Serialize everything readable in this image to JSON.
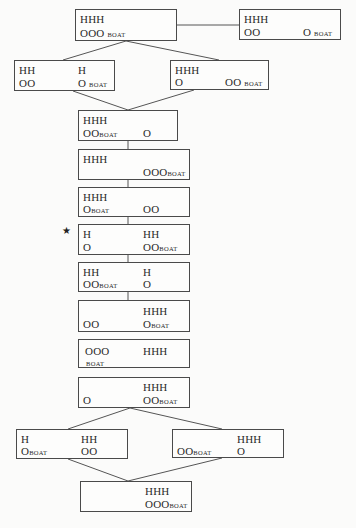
{
  "diagram": {
    "title": "",
    "boat_label": "BOAT",
    "marker": "★",
    "nodes": [
      {
        "id": "n0",
        "tl": "HHH",
        "bl": "OOO",
        "bl_boat": "BOAT",
        "tr": "",
        "br": ""
      },
      {
        "id": "n1",
        "tl": "HHH",
        "bl": "OO",
        "tr": "",
        "br": "O",
        "br_boat": "BOAT"
      },
      {
        "id": "n2",
        "tl": "HH",
        "bl": "OO",
        "tr": "H",
        "br": "O",
        "br_boat": "BOAT"
      },
      {
        "id": "n3",
        "tl": "HHH",
        "bl": "O",
        "tr": "",
        "br": "OO",
        "br_boat": "BOAT"
      },
      {
        "id": "n4",
        "tl": "HHH",
        "bl": "OO",
        "bl_boat": "BOAT",
        "tr": "",
        "br": "O"
      },
      {
        "id": "n5",
        "tl": "HHH",
        "bl": "",
        "tr": "",
        "br": "OOO",
        "br_boat": "BOAT"
      },
      {
        "id": "n6",
        "tl": "HHH",
        "bl": "O",
        "bl_boat": "BOAT",
        "tr": "",
        "br": "OO"
      },
      {
        "id": "n7",
        "tl": "H",
        "bl": "O",
        "tr": "HH",
        "br": "OO",
        "br_boat": "BOAT",
        "starred": true
      },
      {
        "id": "n8",
        "tl": "HH",
        "bl": "OO",
        "bl_boat": "BOAT",
        "tr": "H",
        "br": "O"
      },
      {
        "id": "n9",
        "tl": "",
        "bl": "OO",
        "tr": "HHH",
        "br": "O",
        "br_boat": "BOAT"
      },
      {
        "id": "n10",
        "tl": "OOO",
        "bl": "",
        "bl_boat": "BOAT",
        "tr": "HHH",
        "br": ""
      },
      {
        "id": "n11",
        "tl": "",
        "bl": "O",
        "tr": "HHH",
        "br": "OO",
        "br_boat": "BOAT"
      },
      {
        "id": "n12",
        "tl": "H",
        "bl": "O",
        "bl_boat": "BOAT",
        "tr": "HH",
        "br": "OO"
      },
      {
        "id": "n13",
        "tl": "",
        "bl": "OO",
        "bl_boat": "BOAT",
        "tr": "HHH",
        "br": "O"
      },
      {
        "id": "n14",
        "tl": "",
        "bl": "",
        "tr": "HHH",
        "br": "OOO",
        "br_boat": "BOAT"
      }
    ],
    "edges": [
      [
        "n0",
        "n1"
      ],
      [
        "n0",
        "n2"
      ],
      [
        "n0",
        "n3"
      ],
      [
        "n2",
        "n4"
      ],
      [
        "n3",
        "n4"
      ],
      [
        "n4",
        "n5"
      ],
      [
        "n5",
        "n6"
      ],
      [
        "n6",
        "n7"
      ],
      [
        "n7",
        "n8"
      ],
      [
        "n8",
        "n9"
      ],
      [
        "n11",
        "n12"
      ],
      [
        "n11",
        "n13"
      ],
      [
        "n12",
        "n14"
      ],
      [
        "n13",
        "n14"
      ]
    ]
  }
}
